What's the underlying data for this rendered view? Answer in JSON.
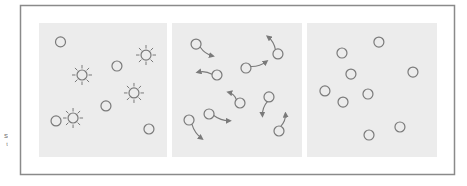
{
  "side_label_fragment": "s\nᵗ",
  "colors": {
    "frame": "#8a8a8a",
    "panel_bg": "#ececec",
    "stroke": "#7a7a7a",
    "background": "#ffffff"
  },
  "panels": [
    {
      "name": "panel-heated",
      "molecules": [
        {
          "type": "circle",
          "x": 0.168,
          "y": 0.141
        },
        {
          "type": "circle",
          "x": 0.609,
          "y": 0.321
        },
        {
          "type": "circle",
          "x": 0.523,
          "y": 0.619
        },
        {
          "type": "circle",
          "x": 0.133,
          "y": 0.731
        },
        {
          "type": "circle",
          "x": 0.859,
          "y": 0.791
        },
        {
          "type": "sun",
          "x": 0.336,
          "y": 0.388
        },
        {
          "type": "sun",
          "x": 0.836,
          "y": 0.239
        },
        {
          "type": "sun",
          "x": 0.742,
          "y": 0.522
        },
        {
          "type": "sun",
          "x": 0.266,
          "y": 0.709
        }
      ]
    },
    {
      "name": "panel-moving",
      "molecules": [
        {
          "type": "moving",
          "x": 0.185,
          "y": 0.157,
          "dx": 0.13,
          "dy": 0.09
        },
        {
          "type": "moving",
          "x": 0.815,
          "y": 0.231,
          "dx": -0.08,
          "dy": -0.13
        },
        {
          "type": "moving",
          "x": 0.569,
          "y": 0.336,
          "dx": 0.16,
          "dy": -0.05
        },
        {
          "type": "moving",
          "x": 0.346,
          "y": 0.388,
          "dx": -0.15,
          "dy": -0.02
        },
        {
          "type": "moving",
          "x": 0.523,
          "y": 0.597,
          "dx": -0.09,
          "dy": -0.08
        },
        {
          "type": "moving",
          "x": 0.746,
          "y": 0.552,
          "dx": -0.05,
          "dy": 0.14
        },
        {
          "type": "moving",
          "x": 0.285,
          "y": 0.679,
          "dx": 0.16,
          "dy": 0.05
        },
        {
          "type": "moving",
          "x": 0.131,
          "y": 0.724,
          "dx": 0.1,
          "dy": 0.14
        },
        {
          "type": "moving",
          "x": 0.823,
          "y": 0.806,
          "dx": 0.05,
          "dy": -0.13
        }
      ]
    },
    {
      "name": "panel-still",
      "molecules": [
        {
          "type": "circle",
          "x": 0.553,
          "y": 0.142
        },
        {
          "type": "circle",
          "x": 0.269,
          "y": 0.224
        },
        {
          "type": "circle",
          "x": 0.338,
          "y": 0.381
        },
        {
          "type": "circle",
          "x": 0.815,
          "y": 0.366
        },
        {
          "type": "circle",
          "x": 0.138,
          "y": 0.507
        },
        {
          "type": "circle",
          "x": 0.469,
          "y": 0.53
        },
        {
          "type": "circle",
          "x": 0.277,
          "y": 0.59
        },
        {
          "type": "circle",
          "x": 0.715,
          "y": 0.776
        },
        {
          "type": "circle",
          "x": 0.477,
          "y": 0.836
        }
      ]
    }
  ]
}
